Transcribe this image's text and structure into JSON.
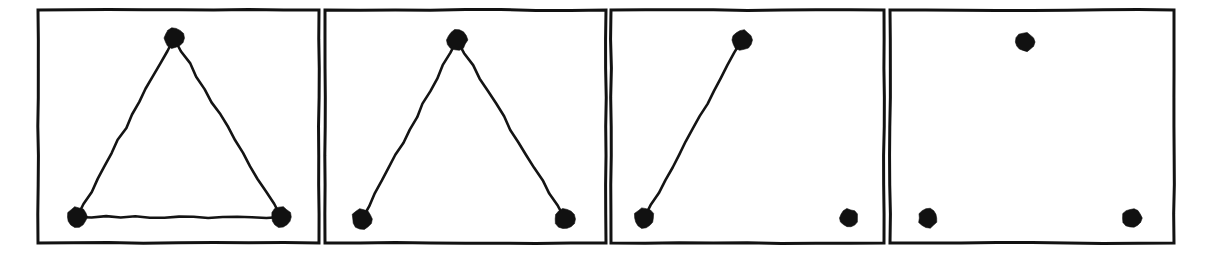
{
  "figure": {
    "background_color": "#ffffff",
    "ink_color": "#111111",
    "panel_border_color": "#121212",
    "panel_count": 4,
    "node_radius": 9.5,
    "edge_stroke_width": 2.6,
    "panel_border_width": 3
  },
  "chart_data": {
    "type": "diagram",
    "grid": false,
    "legend": null,
    "node_labels": [
      "apex",
      "bottom-left",
      "bottom-right"
    ],
    "panels": [
      {
        "index": 1,
        "name": "triangle",
        "edge_count": 3,
        "node_count": 3,
        "frame": {
          "x": 38,
          "y": 10,
          "width": 281,
          "height": 233
        },
        "nodes": [
          {
            "id": "apex",
            "x": 174,
            "y": 38,
            "r": 10
          },
          {
            "id": "bottom-left",
            "x": 77,
            "y": 217,
            "r": 10
          },
          {
            "id": "bottom-right",
            "x": 281,
            "y": 217,
            "r": 10
          }
        ],
        "edges": [
          {
            "from": "apex",
            "to": "bottom-left"
          },
          {
            "from": "apex",
            "to": "bottom-right"
          },
          {
            "from": "bottom-left",
            "to": "bottom-right"
          }
        ]
      },
      {
        "index": 2,
        "name": "path",
        "edge_count": 2,
        "node_count": 3,
        "frame": {
          "x": 325,
          "y": 10,
          "width": 281,
          "height": 233
        },
        "nodes": [
          {
            "id": "apex",
            "x": 457,
            "y": 40,
            "r": 10
          },
          {
            "id": "bottom-left",
            "x": 362,
            "y": 219,
            "r": 10
          },
          {
            "id": "bottom-right",
            "x": 565,
            "y": 219,
            "r": 10
          }
        ],
        "edges": [
          {
            "from": "apex",
            "to": "bottom-left"
          },
          {
            "from": "apex",
            "to": "bottom-right"
          }
        ]
      },
      {
        "index": 3,
        "name": "single-edge",
        "edge_count": 1,
        "node_count": 3,
        "frame": {
          "x": 611,
          "y": 10,
          "width": 273,
          "height": 233
        },
        "nodes": [
          {
            "id": "apex",
            "x": 742,
            "y": 40,
            "r": 10
          },
          {
            "id": "bottom-left",
            "x": 644,
            "y": 218,
            "r": 10
          },
          {
            "id": "bottom-right",
            "x": 849,
            "y": 218,
            "r": 9
          }
        ],
        "edges": [
          {
            "from": "apex",
            "to": "bottom-left"
          }
        ]
      },
      {
        "index": 4,
        "name": "empty",
        "edge_count": 0,
        "node_count": 3,
        "frame": {
          "x": 890,
          "y": 10,
          "width": 284,
          "height": 233
        },
        "nodes": [
          {
            "id": "apex",
            "x": 1025,
            "y": 42,
            "r": 9.5
          },
          {
            "id": "bottom-left",
            "x": 928,
            "y": 218,
            "r": 9.5
          },
          {
            "id": "bottom-right",
            "x": 1132,
            "y": 218,
            "r": 9.5
          }
        ],
        "edges": []
      }
    ]
  }
}
